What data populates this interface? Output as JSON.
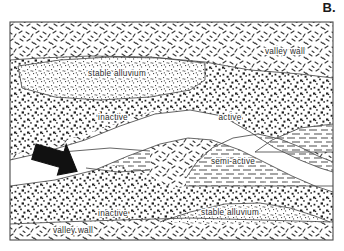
{
  "figure": {
    "panel_letter": "B.",
    "frame": {
      "x": 10,
      "y": 22,
      "width": 323,
      "height": 218,
      "border_color": "#4a4a4a"
    },
    "background_color": "#ffffff"
  },
  "legend_semantics": {
    "valley_wall_fill": "short-dash-scatter",
    "stable_alluvium_fill": "fine-stipple",
    "inactive_fill": "coarse-dot",
    "semi_active_fill": "horizontal-dash",
    "active_fill": "white"
  },
  "units": [
    {
      "id": "valley-wall-top",
      "label": "valley wall",
      "pattern": "short-dash-scatter",
      "label_x": 285,
      "label_y": 52
    },
    {
      "id": "stable-alluvium-top",
      "label": "stable alluvium",
      "pattern": "fine-stipple",
      "label_x": 117,
      "label_y": 74
    },
    {
      "id": "inactive-top",
      "label": "inactive",
      "pattern": "coarse-dot",
      "label_x": 113,
      "label_y": 118
    },
    {
      "id": "active-channel",
      "label": "active",
      "pattern": "white",
      "label_x": 230,
      "label_y": 118
    },
    {
      "id": "semi-active",
      "label": "semi-active",
      "pattern": "horizontal-dash",
      "label_x": 233,
      "label_y": 162
    },
    {
      "id": "inactive-bottom",
      "label": "inactive",
      "pattern": "coarse-dot",
      "label_x": 113,
      "label_y": 214
    },
    {
      "id": "stable-alluvium-bottom",
      "label": "stable alluvium",
      "pattern": "fine-stipple",
      "label_x": 230,
      "label_y": 213
    },
    {
      "id": "valley-wall-bottom",
      "label": "valley wall",
      "pattern": "short-dash-scatter",
      "label_x": 73,
      "label_y": 231
    }
  ],
  "flow_arrow": {
    "name": "flow-direction-arrow",
    "color": "#111111",
    "direction": "down-right"
  }
}
